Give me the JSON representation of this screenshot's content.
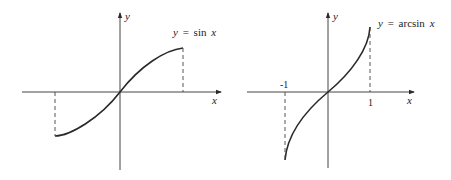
{
  "figure": {
    "left_graph": {
      "x_axis_label": "x",
      "y_axis_label": "y",
      "equation_lhs": "y",
      "equation_eq": "=",
      "equation_fn": "sin",
      "equation_arg": "x",
      "function": "sin",
      "domain": [
        "-π/2",
        "π/2"
      ],
      "range": [
        -1,
        1
      ]
    },
    "right_graph": {
      "x_axis_label": "x",
      "y_axis_label": "y",
      "equation_lhs": "y",
      "equation_eq": "=",
      "equation_fn": "arcsin",
      "equation_arg": "x",
      "tick_neg": "-1",
      "tick_pos": "1",
      "function": "arcsin",
      "domain": [
        -1,
        1
      ],
      "range": [
        "-π/2",
        "π/2"
      ]
    },
    "colors": {
      "stroke": "#2a2a2a",
      "background": "#ffffff"
    }
  }
}
